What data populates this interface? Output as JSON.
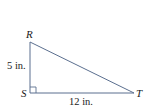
{
  "diagram": {
    "type": "right-triangle",
    "colors": {
      "line": "#5b6f8f",
      "text": "#1a1a1a",
      "background": "#ffffff"
    },
    "vertices": {
      "R": {
        "label": "R",
        "x": 30,
        "y": 42
      },
      "S": {
        "label": "S",
        "x": 30,
        "y": 93
      },
      "T": {
        "label": "T",
        "x": 134,
        "y": 93
      }
    },
    "right_angle_at": "S",
    "sides": {
      "RS": {
        "label": "5 in.",
        "length": 5,
        "unit": "in."
      },
      "ST": {
        "label": "12 in.",
        "length": 12,
        "unit": "in."
      },
      "RT": {
        "label": ""
      }
    }
  }
}
